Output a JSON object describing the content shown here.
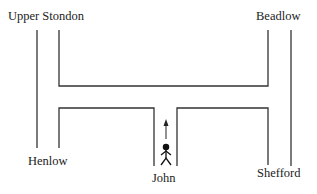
{
  "diagram": {
    "type": "road-map-puzzle",
    "places": {
      "upper_stondon": "Upper Stondon",
      "beadlow": "Beadlow",
      "henlow": "Henlow",
      "shefford": "Shefford",
      "john": "John"
    },
    "figure": {
      "name": "John",
      "facing": "north",
      "arrow_direction": "up"
    },
    "colors": {
      "line": "#333333",
      "text": "#222222",
      "background": "#ffffff"
    }
  }
}
